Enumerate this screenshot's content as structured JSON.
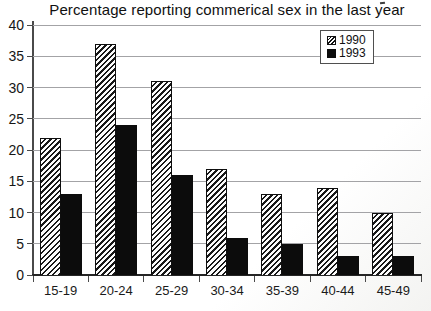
{
  "chart_data": {
    "type": "bar",
    "title": "Percentage reporting commerical sex in the last year",
    "categories": [
      "15-19",
      "20-24",
      "25-29",
      "30-34",
      "35-39",
      "40-44",
      "45-49"
    ],
    "series": [
      {
        "name": "1990",
        "style": "hatched",
        "values": [
          22,
          37,
          31,
          17,
          13,
          14,
          10
        ]
      },
      {
        "name": "1993",
        "style": "solid-black",
        "values": [
          13,
          24,
          16,
          6,
          5,
          3,
          3
        ]
      }
    ],
    "xlabel": "",
    "ylabel": "",
    "ylim": [
      0,
      40
    ],
    "ytick_step": 5,
    "y_tick_labels": [
      "0",
      "5",
      "10",
      "15",
      "20",
      "25",
      "30",
      "35",
      "40"
    ],
    "grid": "horizontal-only",
    "legend_position": "top-right-inside",
    "colors": {
      "series_1990_fill": "white-with-black-diagonal-hatch",
      "series_1993_fill": "#0c0c0c",
      "gridline": "#a3a3a6",
      "axis": "#4a4a4a",
      "background": "#ffffff",
      "text": "#101010"
    }
  },
  "legend": {
    "items": [
      {
        "label": "1990",
        "swatch": "hatched"
      },
      {
        "label": "1993",
        "swatch": "black"
      }
    ]
  }
}
